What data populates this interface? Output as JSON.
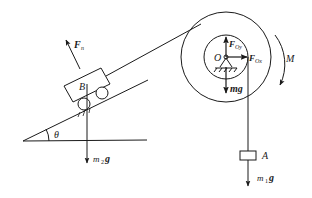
{
  "diagram": {
    "labels": {
      "normal_force": "F",
      "normal_force_sub": "n",
      "cart": "B",
      "cart_weight": "m",
      "cart_weight_sub": "2",
      "cart_weight_g": "g",
      "angle": "θ",
      "pivot": "O",
      "reaction_y": "F",
      "reaction_y_sub": "Oy",
      "reaction_x": "F",
      "reaction_x_sub": "Ox",
      "pulley_weight": "mg",
      "moment": "M",
      "block": "A",
      "block_weight": "m",
      "block_weight_sub": "1",
      "block_weight_g": "g"
    },
    "colors": {
      "stroke": "#1a1a1a",
      "background": "#ffffff"
    }
  }
}
